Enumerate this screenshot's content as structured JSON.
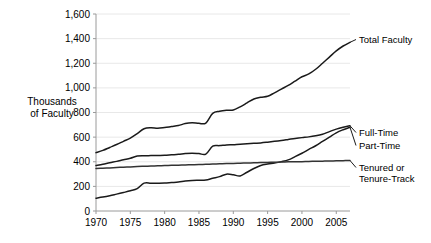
{
  "chart_data": {
    "type": "line",
    "title": "",
    "subtitle": "",
    "xlabel": "",
    "ylabel": "Thousands of Faculty",
    "ylabel_line1": "Thousands",
    "ylabel_line2": "of Faculty",
    "grid": true,
    "legend_position": "right-inline-labels",
    "xlim": [
      1970,
      2007
    ],
    "ylim": [
      0,
      1600
    ],
    "xticks": [
      1970,
      1975,
      1980,
      1985,
      1990,
      1995,
      2000,
      2005
    ],
    "xtick_labels": [
      "1970",
      "1975",
      "1980",
      "1985",
      "1990",
      "1995",
      "2000",
      "2005"
    ],
    "yticks": [
      0,
      200,
      400,
      600,
      800,
      1000,
      1200,
      1400,
      1600
    ],
    "ytick_labels": [
      "0",
      "200",
      "400",
      "600",
      "800",
      "1,000",
      "1,200",
      "1,400",
      "1,600"
    ],
    "x": [
      1970,
      1971,
      1972,
      1973,
      1974,
      1975,
      1976,
      1977,
      1978,
      1979,
      1980,
      1981,
      1982,
      1983,
      1984,
      1985,
      1986,
      1987,
      1988,
      1989,
      1990,
      1991,
      1992,
      1993,
      1994,
      1995,
      1996,
      1997,
      1998,
      1999,
      2000,
      2001,
      2002,
      2003,
      2004,
      2005,
      2006,
      2007
    ],
    "series": [
      {
        "name": "Total Faculty",
        "color": "#1a1a1a",
        "label": "Total Faculty",
        "values": [
          474,
          492,
          516,
          540,
          566,
          592,
          628,
          668,
          676,
          672,
          678,
          686,
          694,
          710,
          716,
          712,
          714,
          793,
          810,
          818,
          820,
          846,
          878,
          910,
          924,
          932,
          960,
          990,
          1020,
          1055,
          1090,
          1113,
          1151,
          1200,
          1250,
          1300,
          1340,
          1370
        ]
      },
      {
        "name": "Full-Time",
        "color": "#1a1a1a",
        "label": "Full-Time",
        "values": [
          369,
          379,
          392,
          403,
          416,
          428,
          446,
          449,
          450,
          451,
          452,
          456,
          460,
          466,
          469,
          466,
          462,
          527,
          531,
          536,
          539,
          543,
          546,
          550,
          553,
          559,
          566,
          573,
          581,
          589,
          596,
          602,
          611,
          624,
          645,
          665,
          680,
          692
        ]
      },
      {
        "name": "Part-Time",
        "color": "#1a1a1a",
        "label": "Part-Time",
        "values": [
          104,
          113,
          124,
          137,
          150,
          164,
          182,
          226,
          226,
          226,
          227,
          231,
          235,
          243,
          248,
          250,
          252,
          266,
          279,
          299,
          294,
          285,
          315,
          345,
          370,
          382,
          390,
          401,
          415,
          441,
          469,
          500,
          530,
          565,
          600,
          635,
          660,
          680
        ]
      },
      {
        "name": "Tenured or Tenure-Track",
        "color": "#333333",
        "label_line1": "Tenured or",
        "label_line2": "Tenure-Track",
        "values": [
          345,
          348,
          350,
          353,
          356,
          358,
          361,
          363,
          365,
          367,
          369,
          371,
          372,
          374,
          376,
          378,
          379,
          381,
          383,
          385,
          386,
          388,
          390,
          391,
          393,
          394,
          396,
          397,
          399,
          400,
          401,
          403,
          404,
          405,
          406,
          408,
          409,
          410
        ]
      }
    ],
    "annotations": []
  },
  "colors": {
    "background": "#ffffff",
    "gridline": "#e8e8e8",
    "axis": "#9a9a9a",
    "line": "#1a1a1a",
    "text": "#000000"
  }
}
